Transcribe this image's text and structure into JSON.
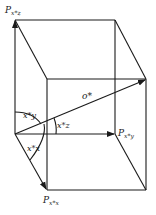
{
  "diagram": {
    "type": "3d-box-vector-projection",
    "stroke_color": "#1a1a1a",
    "background": "#ffffff",
    "labels": {
      "top_point": {
        "main": "P",
        "sub": "x*z"
      },
      "right_point": {
        "main": "P",
        "sub": "x*y"
      },
      "bottom_point": {
        "main": "P",
        "sub": "x*x"
      },
      "vector": "o*",
      "angle_y": "x*y",
      "angle_z": "x*z",
      "angle_x": "x*x"
    }
  }
}
